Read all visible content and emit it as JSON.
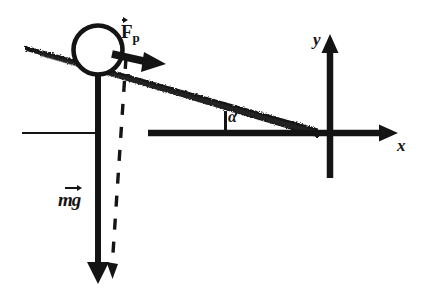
{
  "figure": {
    "kind": "physics-free-body-diagram",
    "background_color": "#ffffff",
    "ink_color": "#141414"
  },
  "labels": {
    "applied_force": {
      "symbol": "F",
      "subscript": "p",
      "vector": true,
      "text": "Fp"
    },
    "weight": {
      "mass_symbol": "m",
      "gravity_symbol": "g",
      "vector": true,
      "text": "mg"
    },
    "angle": {
      "symbol": "α",
      "text": "α"
    },
    "axis_y": {
      "symbol": "y",
      "text": "y"
    },
    "axis_x": {
      "symbol": "x",
      "text": "x"
    }
  },
  "geometry": {
    "incline": {
      "left_point": [
        25,
        47
      ],
      "right_point": [
        318,
        133
      ],
      "thickness_left_px": 4,
      "thickness_right_px": 9,
      "angle_deg": 16
    },
    "ball": {
      "center": [
        98,
        50
      ],
      "radius": 25,
      "stroke_width": 4,
      "fill": "#ffffff"
    },
    "applied_force_arrow": {
      "from": [
        118,
        55
      ],
      "to": [
        158,
        64
      ],
      "width": 7
    },
    "weight_arrow": {
      "from": [
        98,
        62
      ],
      "to": [
        98,
        278
      ],
      "width": 6
    },
    "dashed_line": {
      "from": [
        124,
        60
      ],
      "to": [
        113,
        272
      ],
      "dash_px": 11,
      "gap_px": 11
    },
    "x_axis": {
      "from": [
        148,
        133
      ],
      "to": [
        392,
        133
      ],
      "width": 6
    },
    "y_axis": {
      "from": [
        330,
        178
      ],
      "to": [
        330,
        38
      ],
      "width": 6
    },
    "origin": [
      330,
      133
    ],
    "angle_tick": {
      "from": [
        225,
        133
      ],
      "to": [
        225,
        112
      ],
      "width": 3
    },
    "ground_line_left": {
      "from": [
        22,
        133
      ],
      "to": [
        96,
        133
      ],
      "width": 2
    }
  }
}
